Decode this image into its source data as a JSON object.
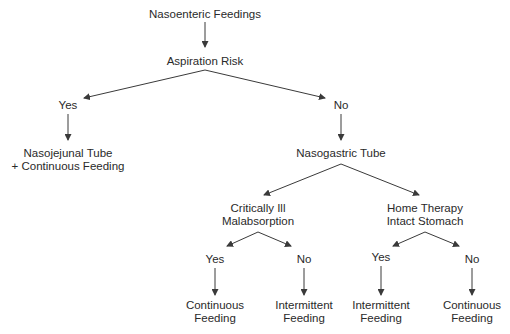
{
  "diagram": {
    "type": "decision-tree",
    "nodes": {
      "root": "Nasoenteric Feedings",
      "aspiration": "Aspiration Risk",
      "asp_yes": "Yes",
      "asp_no": "No",
      "nj_line1": "Nasojejunal Tube",
      "nj_line2": "+ Continuous Feeding",
      "ng": "Nasogastric Tube",
      "crit_line1": "Critically Ill",
      "crit_line2": "Malabsorption",
      "home_line1": "Home Therapy",
      "home_line2": "Intact Stomach",
      "crit_yes": "Yes",
      "crit_no": "No",
      "home_yes": "Yes",
      "home_no": "No",
      "crit_yes_result_line1": "Continuous",
      "crit_yes_result_line2": "Feeding",
      "crit_no_result_line1": "Intermittent",
      "crit_no_result_line2": "Feeding",
      "home_yes_result_line1": "Intermittent",
      "home_yes_result_line2": "Feeding",
      "home_no_result_line1": "Continuous",
      "home_no_result_line2": "Feeding"
    },
    "colors": {
      "text": "#2a2a2a",
      "line": "#3a3a3a",
      "background": "#ffffff"
    }
  }
}
